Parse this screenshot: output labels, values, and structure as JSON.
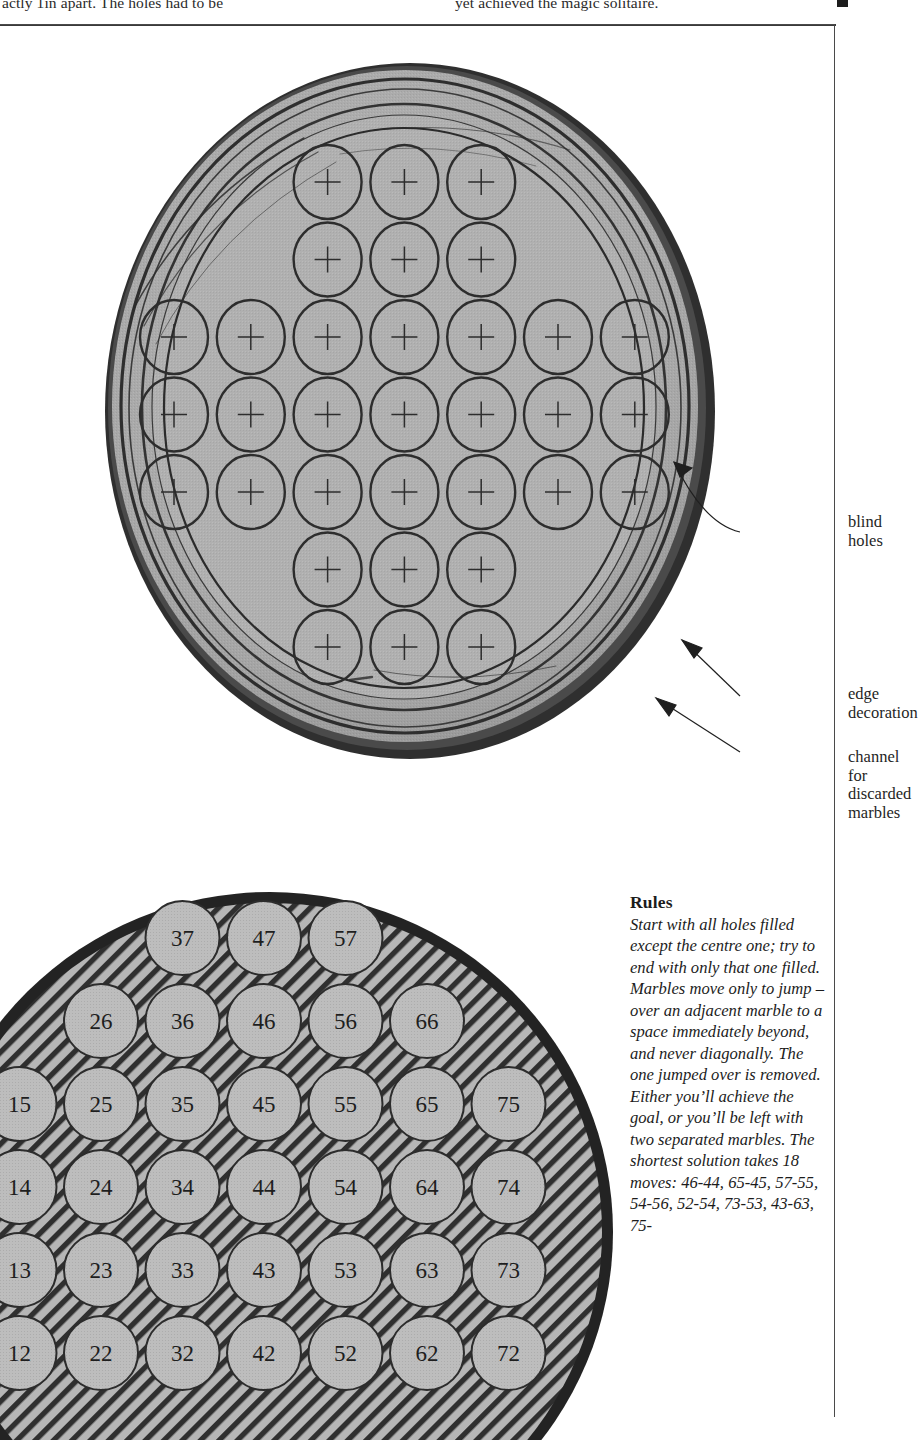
{
  "page": {
    "top_text_left": "actly  1in  apart.  The  holes  had  to  be",
    "top_text_right": "yet achieved the magic solitaire.",
    "end_marker": "end-of-article-square"
  },
  "upper_board": {
    "caption_blind_holes": "blind\nholes",
    "caption_edge_decoration": "edge\ndecoration",
    "caption_channel": "channel for\ndiscarded\nmarbles",
    "colors": {
      "wood_fill": "#a9a9a9",
      "wood_fill_inner": "#b0b0b0",
      "rim_dark": "#2b2b2b",
      "hole_outline": "#2d2d2d"
    },
    "hole_marker": "cross",
    "rows": [
      {
        "y": 0,
        "count": 3,
        "start": 2
      },
      {
        "y": 1,
        "count": 3,
        "start": 2
      },
      {
        "y": 2,
        "count": 7,
        "start": 0
      },
      {
        "y": 3,
        "count": 7,
        "start": 0
      },
      {
        "y": 4,
        "count": 7,
        "start": 0
      },
      {
        "y": 5,
        "count": 3,
        "start": 2
      },
      {
        "y": 6,
        "count": 3,
        "start": 2
      }
    ],
    "total_holes": 33
  },
  "lower_diagram": {
    "colors": {
      "hatch_line": "#333333",
      "board_fill": "#b4b4b4",
      "circle_fill": "#b9b9b9",
      "rim": "#2a2a2a"
    },
    "grid": [
      {
        "row": 0,
        "labels": [
          "37",
          "47",
          "57"
        ],
        "cols": [
          3,
          4,
          5
        ]
      },
      {
        "row": 1,
        "labels": [
          "26",
          "36",
          "46",
          "56",
          "66"
        ],
        "cols": [
          2,
          3,
          4,
          5,
          6
        ]
      },
      {
        "row": 2,
        "labels": [
          "15",
          "25",
          "35",
          "45",
          "55",
          "65",
          "75"
        ],
        "cols": [
          1,
          2,
          3,
          4,
          5,
          6,
          7
        ]
      },
      {
        "row": 3,
        "labels": [
          "14",
          "24",
          "34",
          "44",
          "54",
          "64",
          "74"
        ],
        "cols": [
          1,
          2,
          3,
          4,
          5,
          6,
          7
        ]
      },
      {
        "row": 4,
        "labels": [
          "13",
          "23",
          "33",
          "43",
          "53",
          "63",
          "73"
        ],
        "cols": [
          1,
          2,
          3,
          4,
          5,
          6,
          7
        ]
      },
      {
        "row": 5,
        "labels": [
          "12",
          "22",
          "32",
          "42",
          "52",
          "62",
          "72"
        ],
        "cols": [
          1,
          2,
          3,
          4,
          5,
          6,
          7
        ]
      }
    ]
  },
  "rules": {
    "heading": "Rules",
    "body": "Start with all holes filled except the centre one; try to end with only that one filled. Marbles move only to jump – over an adjacent marble to a space immediately beyond, and never diagonally. The one jumped over is removed. Either you’ll achieve the goal, or you’ll be left with two separated marbles. The shortest solution takes 18 moves: 46-44, 65-45, 57-55, 54-56, 52-54, 73-53, 43-63, 75-"
  }
}
